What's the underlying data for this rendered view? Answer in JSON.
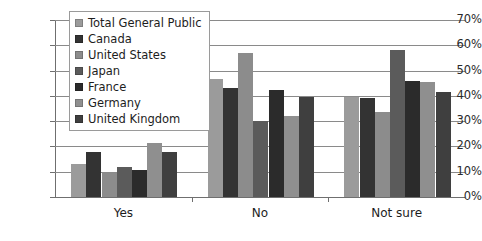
{
  "chart_data": {
    "type": "bar",
    "title": "",
    "xlabel": "",
    "ylabel": "",
    "ylim": [
      0,
      70
    ],
    "ytick_labels": [
      "0%",
      "10%",
      "20%",
      "30%",
      "40%",
      "50%",
      "60%",
      "70%"
    ],
    "ytick_values": [
      0,
      10,
      20,
      30,
      40,
      50,
      60,
      70
    ],
    "grid": true,
    "legend_position": "upper-left-inside",
    "categories": [
      "Yes",
      "No",
      "Not sure"
    ],
    "series": [
      {
        "name": "Total General Public",
        "color": "#9b9b9b",
        "values": [
          13.0,
          46.5,
          39.5
        ]
      },
      {
        "name": "Canada",
        "color": "#333333",
        "values": [
          18.0,
          43.0,
          39.0
        ]
      },
      {
        "name": "United States",
        "color": "#8c8c8c",
        "values": [
          9.5,
          57.0,
          33.5
        ]
      },
      {
        "name": "Japan",
        "color": "#5b5b5b",
        "values": [
          12.0,
          30.0,
          58.0
        ]
      },
      {
        "name": "France",
        "color": "#2b2b2b",
        "values": [
          10.5,
          42.5,
          46.0
        ]
      },
      {
        "name": "Germany",
        "color": "#8f8f8f",
        "values": [
          21.5,
          32.0,
          45.5
        ]
      },
      {
        "name": "United Kingdom",
        "color": "#3f3f3f",
        "values": [
          18.0,
          39.5,
          41.5
        ]
      }
    ]
  }
}
